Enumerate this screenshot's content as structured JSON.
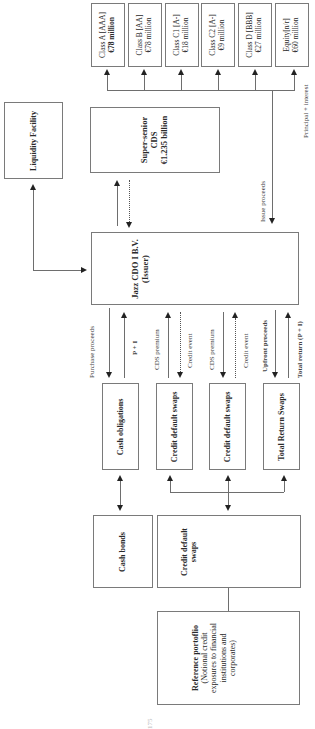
{
  "tranches": [
    {
      "name": "Class A [AAA]",
      "amount": "€78 million"
    },
    {
      "name": "Class B [AA]",
      "amount": "€78 million"
    },
    {
      "name": "Class C1 [A-]",
      "amount": "€18 million"
    },
    {
      "name": "Class C2 [A-]",
      "amount": "€9 million"
    },
    {
      "name": "Class D [BBB]",
      "amount": "€27 million"
    },
    {
      "name": "Equity[n/r]",
      "amount": "€60 million"
    }
  ],
  "liquidity_facility": {
    "label": "Liquidity Facility"
  },
  "super_senior": {
    "line1": "Super-senior",
    "line2": "CDS",
    "line3": "€1.235 billion"
  },
  "issuer": {
    "line1": "Jazz CDO I B.V.",
    "line2": "(Issuer)"
  },
  "flow_labels": {
    "principal_interest": "Principal + interest",
    "issue_proceeds": "Issue proceeds",
    "purchase_proceeds": "Purchase proceeds",
    "p_plus_i": "P + I",
    "cds_premium_1": "CDS premium",
    "credit_event_1": "Credit event",
    "cds_premium_2": "CDS premium",
    "credit_event_2": "Credit event",
    "upfront_proceeds": "Upfront proceeds",
    "total_return": "Total return (P + I)"
  },
  "instruments": {
    "cash_obligations": "Cash obligations",
    "cds_1": "Credit default swaps",
    "cds_2": "Credit default swaps",
    "trs": "Total Return Swaps"
  },
  "underlying": {
    "cash_bonds": "Cash bonds",
    "cds_line1": "Credit default",
    "cds_line2": "swaps"
  },
  "reference_portfolio": {
    "title": "Reference portoflio",
    "line1": "(Notional credit",
    "line2": "exposures to financial",
    "line3": "institutions and",
    "line4": "corporates)"
  },
  "page_number": "175"
}
